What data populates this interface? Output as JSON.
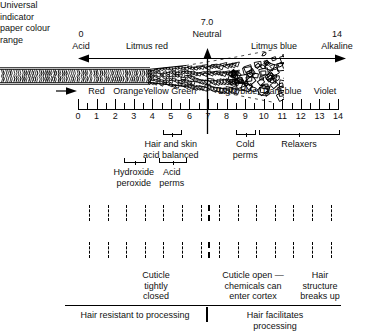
{
  "diagram": {
    "ph_axis": {
      "left_value": "0",
      "left_label": "Acid",
      "right_value": "14",
      "right_label": "Alkaline",
      "neutral_value": "7.0",
      "neutral_label": "Neutral",
      "left_region_label": "Litmus red",
      "right_region_label": "Litmus blue"
    },
    "universal_indicator": {
      "line1": "Universal",
      "line2": "indicator",
      "line3": "paper colour",
      "line4": "range"
    },
    "colour_bands": [
      {
        "label": "Red",
        "center_ph": 1.0
      },
      {
        "label": "Orange",
        "center_ph": 2.7
      },
      {
        "label": "Yellow",
        "center_ph": 4.2
      },
      {
        "label": "Green",
        "center_ph": 5.7
      },
      {
        "label": "Light blue",
        "center_ph": 8.6
      },
      {
        "label": "Dark blue",
        "center_ph": 11.0
      },
      {
        "label": "Violet",
        "center_ph": 13.3
      }
    ],
    "scale": {
      "min": 0,
      "max": 14,
      "tick_labels": [
        "0",
        "1",
        "2",
        "3",
        "4",
        "5",
        "6",
        "7",
        "8",
        "9",
        "10",
        "11",
        "12",
        "13",
        "14"
      ]
    },
    "brackets": [
      {
        "name": "hair-and-skin",
        "from_ph": 4.55,
        "to_ph": 5.5,
        "label_lines": [
          "Hair and skin",
          "acid balanced"
        ],
        "label_center_ph": 5.0,
        "label_top": 139
      },
      {
        "name": "hydroxide-peroxide",
        "from_ph": 2.45,
        "to_ph": 3.55,
        "label_lines": [
          "Hydroxide",
          "peroxide"
        ],
        "label_center_ph": 3.0,
        "label_top": 167
      },
      {
        "name": "acid-perms",
        "from_ph": 4.35,
        "to_ph": 5.75,
        "label_lines": [
          "Acid",
          "perms"
        ],
        "label_center_ph": 5.05,
        "label_top": 167
      },
      {
        "name": "cold-perms",
        "from_ph": 8.5,
        "to_ph": 9.5,
        "label_lines": [
          "Cold",
          "perms"
        ],
        "label_center_ph": 9.0,
        "label_top": 139
      },
      {
        "name": "relaxers",
        "from_ph": 9.72,
        "to_ph": 14.0,
        "label_lines": [
          "Relaxers"
        ],
        "label_center_ph": 11.9,
        "label_top": 139
      }
    ],
    "hair_captions": [
      {
        "name": "cuticle-tightly-closed",
        "lines": [
          "Cuticle",
          "tightly",
          "closed"
        ],
        "center_x": 156,
        "top": 270
      },
      {
        "name": "cuticle-open",
        "lines": [
          "Cuticle open —",
          "chemicals can",
          "enter cortex"
        ],
        "center_x": 253,
        "top": 270
      },
      {
        "name": "hair-structure-breaks-up",
        "lines": [
          "Hair",
          "structure",
          "breaks up"
        ],
        "center_x": 320,
        "top": 270
      }
    ],
    "bottom_labels": [
      {
        "name": "hair-resistant",
        "text": "Hair resistant to processing",
        "center_x": 135,
        "top": 310
      },
      {
        "name": "hair-facilitates",
        "text": "Hair facilitates processing",
        "center_x": 275,
        "top": 310
      }
    ],
    "colors": {
      "ink": "#111111",
      "background": "#ffffff",
      "line": "#000000"
    }
  }
}
